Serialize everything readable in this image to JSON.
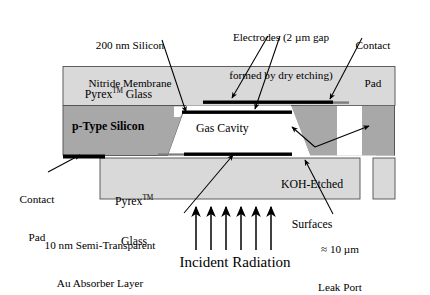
{
  "figure": {
    "background_color": "#ffffff"
  },
  "colors": {
    "glass": "#d9d9d9",
    "silicon": "#a8a8a8",
    "cavity": "#ffffff",
    "electrode": "#000000",
    "outline": "#555555",
    "text": "#000000"
  },
  "labels": {
    "membrane": {
      "line1": "200 nm Silicon",
      "line2": "Nitride Membrane"
    },
    "electrodes": {
      "line1": "Electrodes (2 µm gap",
      "line2": "formed by dry etching)"
    },
    "contact_pad_top": {
      "line1": "Contact",
      "line2": "Pad"
    },
    "contact_pad_left": {
      "line1": "Contact",
      "line2": "Pad"
    },
    "koh": {
      "line1": "KOH-Etched",
      "line2": "Surfaces"
    },
    "absorber": {
      "line1": "10 nm Semi-Transparent",
      "line2": "Au Absorber Layer"
    },
    "leak_port": {
      "line1": "≈ 10 µm",
      "line2": "Leak Port"
    },
    "incident_radiation": "Incident Radiation"
  },
  "regions": {
    "pyrex_top": {
      "name": "Pyrex™ Glass",
      "text_main": "Pyrex",
      "text_sup": "TM",
      "text_tail": " Glass"
    },
    "pyrex_bottom": {
      "name": "Pyrex™ Glass",
      "line1_main": "Pyrex",
      "line1_sup": "TM",
      "line2": "Glass"
    },
    "silicon": {
      "name": "p-Type Silicon",
      "text": "p-Type Silicon"
    },
    "cavity": {
      "name": "Gas Cavity",
      "text": "Gas Cavity"
    }
  },
  "radiation": {
    "arrow_count": 6,
    "arrow_x": [
      196,
      211,
      226,
      241,
      256,
      271
    ],
    "arrow_top_y": 205,
    "arrow_bottom_y": 250
  }
}
